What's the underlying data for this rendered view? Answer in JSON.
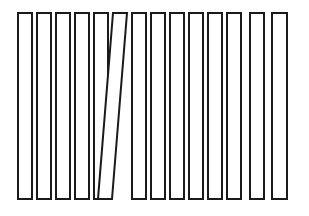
{
  "figure": {
    "canvas": {
      "width": 309,
      "height": 216
    },
    "background_color": "#ffffff",
    "stroke_color": "#1a1a1a",
    "fill_color": "#ffffff",
    "stroke_width": 2,
    "bar_count": 14,
    "tilted_bar_index": 5
  },
  "chart_data": {
    "type": "bar",
    "xlabel": "",
    "ylabel": "",
    "grid": false,
    "legend": false,
    "categories": [
      "1",
      "2",
      "3",
      "4",
      "5",
      "6",
      "7",
      "8",
      "9",
      "10",
      "11",
      "12",
      "13",
      "14"
    ],
    "values": [
      186,
      186,
      186,
      186,
      186,
      186,
      186,
      186,
      186,
      186,
      186,
      186,
      186,
      186
    ],
    "bars": [
      {
        "name": "bar-1",
        "tilted": false,
        "top_left_x": 18,
        "top_right_x": 32,
        "bottom_left_x": 18,
        "bottom_right_x": 32,
        "top_y": 13,
        "bottom_y": 199
      },
      {
        "name": "bar-2",
        "tilted": false,
        "top_left_x": 37,
        "top_right_x": 51,
        "bottom_left_x": 37,
        "bottom_right_x": 51,
        "top_y": 13,
        "bottom_y": 199
      },
      {
        "name": "bar-3",
        "tilted": false,
        "top_left_x": 56,
        "top_right_x": 70,
        "bottom_left_x": 56,
        "bottom_right_x": 70,
        "top_y": 13,
        "bottom_y": 199
      },
      {
        "name": "bar-4",
        "tilted": false,
        "top_left_x": 75,
        "top_right_x": 89,
        "bottom_left_x": 75,
        "bottom_right_x": 89,
        "top_y": 13,
        "bottom_y": 199
      },
      {
        "name": "bar-5",
        "tilted": false,
        "top_left_x": 94,
        "top_right_x": 108,
        "bottom_left_x": 94,
        "bottom_right_x": 108,
        "top_y": 13,
        "bottom_y": 199
      },
      {
        "name": "bar-6",
        "tilted": true,
        "top_left_x": 113,
        "top_right_x": 127,
        "bottom_left_x": 98,
        "bottom_right_x": 112,
        "top_y": 13,
        "bottom_y": 199
      },
      {
        "name": "bar-7",
        "tilted": false,
        "top_left_x": 132,
        "top_right_x": 146,
        "bottom_left_x": 132,
        "bottom_right_x": 146,
        "top_y": 13,
        "bottom_y": 199
      },
      {
        "name": "bar-8",
        "tilted": false,
        "top_left_x": 151,
        "top_right_x": 165,
        "bottom_left_x": 151,
        "bottom_right_x": 165,
        "top_y": 13,
        "bottom_y": 199
      },
      {
        "name": "bar-9",
        "tilted": false,
        "top_left_x": 170,
        "top_right_x": 184,
        "bottom_left_x": 170,
        "bottom_right_x": 184,
        "top_y": 13,
        "bottom_y": 199
      },
      {
        "name": "bar-10",
        "tilted": false,
        "top_left_x": 189,
        "top_right_x": 203,
        "bottom_left_x": 189,
        "bottom_right_x": 203,
        "top_y": 13,
        "bottom_y": 199
      },
      {
        "name": "bar-11",
        "tilted": false,
        "top_left_x": 208,
        "top_right_x": 222,
        "bottom_left_x": 208,
        "bottom_right_x": 222,
        "top_y": 13,
        "bottom_y": 199
      },
      {
        "name": "bar-12",
        "tilted": false,
        "top_left_x": 227,
        "top_right_x": 241,
        "bottom_left_x": 227,
        "bottom_right_x": 241,
        "top_y": 13,
        "bottom_y": 199
      },
      {
        "name": "bar-13",
        "tilted": false,
        "top_left_x": 250,
        "top_right_x": 264,
        "bottom_left_x": 250,
        "bottom_right_x": 264,
        "top_y": 13,
        "bottom_y": 199
      },
      {
        "name": "bar-14",
        "tilted": false,
        "top_left_x": 272,
        "top_right_x": 287,
        "bottom_left_x": 272,
        "bottom_right_x": 287,
        "top_y": 13,
        "bottom_y": 199
      }
    ]
  }
}
